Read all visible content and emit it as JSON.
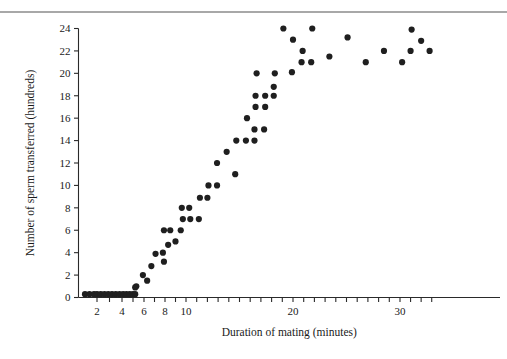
{
  "figure": {
    "top_rule_color": "#a8a8a8",
    "background": "#ffffff",
    "point_color": "#1f1f1f",
    "axis_color": "#2a2a2a"
  },
  "chart_data": {
    "type": "scatter",
    "title": "",
    "xlabel": "Duration of mating (minutes)",
    "ylabel": "Number of sperm transferred (hundreds)",
    "grid": false,
    "legend": "none",
    "ylim": [
      0,
      24
    ],
    "yticks": [
      0,
      2,
      4,
      6,
      8,
      10,
      12,
      14,
      16,
      18,
      20,
      22,
      24
    ],
    "ytick_labels": [
      "0",
      "2",
      "4",
      "6",
      "8",
      "10",
      "12",
      "14",
      "16",
      "18",
      "20",
      "22",
      "24"
    ],
    "xtick_labels": [
      "2",
      "4",
      "6",
      "8",
      "10",
      "20",
      "30"
    ],
    "xticks": [
      2,
      4,
      6,
      8,
      10,
      20,
      30
    ],
    "x_axis_note": "compressed / nonlinear spacing at low values; ticks evenly spaced",
    "points": [
      {
        "x": 1.2,
        "y": 0.3
      },
      {
        "x": 1.5,
        "y": 0.3
      },
      {
        "x": 1.8,
        "y": 0.3
      },
      {
        "x": 2.0,
        "y": 0.3
      },
      {
        "x": 2.3,
        "y": 0.3
      },
      {
        "x": 2.6,
        "y": 0.3
      },
      {
        "x": 2.9,
        "y": 0.3
      },
      {
        "x": 3.2,
        "y": 0.3
      },
      {
        "x": 3.5,
        "y": 0.3
      },
      {
        "x": 3.8,
        "y": 0.3
      },
      {
        "x": 4.1,
        "y": 0.3
      },
      {
        "x": 4.4,
        "y": 0.3
      },
      {
        "x": 4.7,
        "y": 0.3
      },
      {
        "x": 5.0,
        "y": 0.3
      },
      {
        "x": 5.2,
        "y": 0.3
      },
      {
        "x": 5.2,
        "y": 0.9
      },
      {
        "x": 5.3,
        "y": 1.0
      },
      {
        "x": 5.9,
        "y": 2.0
      },
      {
        "x": 6.3,
        "y": 1.5
      },
      {
        "x": 6.7,
        "y": 2.8
      },
      {
        "x": 7.1,
        "y": 3.9
      },
      {
        "x": 7.8,
        "y": 4.0
      },
      {
        "x": 7.9,
        "y": 3.2
      },
      {
        "x": 7.9,
        "y": 6.0
      },
      {
        "x": 8.3,
        "y": 4.7
      },
      {
        "x": 8.5,
        "y": 6.0
      },
      {
        "x": 9.0,
        "y": 5.0
      },
      {
        "x": 9.5,
        "y": 6.0
      },
      {
        "x": 9.6,
        "y": 8.0
      },
      {
        "x": 9.7,
        "y": 7.0
      },
      {
        "x": 10.3,
        "y": 8.0
      },
      {
        "x": 10.4,
        "y": 7.0
      },
      {
        "x": 11.2,
        "y": 7.0
      },
      {
        "x": 11.3,
        "y": 8.9
      },
      {
        "x": 12.0,
        "y": 8.9
      },
      {
        "x": 12.1,
        "y": 10.0
      },
      {
        "x": 12.9,
        "y": 10.0
      },
      {
        "x": 12.9,
        "y": 12.0
      },
      {
        "x": 13.8,
        "y": 13.0
      },
      {
        "x": 14.6,
        "y": 11.0
      },
      {
        "x": 14.7,
        "y": 14.0
      },
      {
        "x": 15.6,
        "y": 14.0
      },
      {
        "x": 15.7,
        "y": 16.0
      },
      {
        "x": 16.4,
        "y": 14.0
      },
      {
        "x": 16.4,
        "y": 15.0
      },
      {
        "x": 16.5,
        "y": 17.0
      },
      {
        "x": 16.5,
        "y": 18.0
      },
      {
        "x": 16.6,
        "y": 20.0
      },
      {
        "x": 17.3,
        "y": 15.0
      },
      {
        "x": 17.4,
        "y": 17.0
      },
      {
        "x": 17.4,
        "y": 18.0
      },
      {
        "x": 18.2,
        "y": 18.0
      },
      {
        "x": 18.2,
        "y": 18.8
      },
      {
        "x": 18.3,
        "y": 20.0
      },
      {
        "x": 19.1,
        "y": 24.0
      },
      {
        "x": 19.9,
        "y": 20.1
      },
      {
        "x": 20.0,
        "y": 23.0
      },
      {
        "x": 20.8,
        "y": 21.0
      },
      {
        "x": 20.9,
        "y": 22.0
      },
      {
        "x": 21.7,
        "y": 21.0
      },
      {
        "x": 21.8,
        "y": 24.0
      },
      {
        "x": 23.4,
        "y": 21.5
      },
      {
        "x": 25.1,
        "y": 23.2
      },
      {
        "x": 26.8,
        "y": 21.0
      },
      {
        "x": 28.5,
        "y": 22.0
      },
      {
        "x": 30.2,
        "y": 21.0
      },
      {
        "x": 31.0,
        "y": 22.0
      },
      {
        "x": 31.1,
        "y": 23.9
      },
      {
        "x": 32.0,
        "y": 22.9
      },
      {
        "x": 32.8,
        "y": 22.0
      }
    ]
  }
}
